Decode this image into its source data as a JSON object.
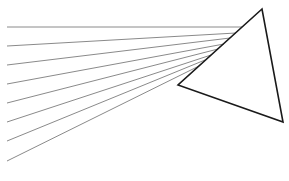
{
  "diagram": {
    "background": "#ffffff",
    "triangle": {
      "stroke": "#1a1a1a",
      "stroke_width": 1.6,
      "points": [
        [
          262,
          9
        ],
        [
          178,
          85
        ],
        [
          283,
          122
        ]
      ]
    },
    "rays": {
      "stroke": "#8a8a8a",
      "stroke_width": 1.0,
      "lines": [
        {
          "x1": 7,
          "y1": 27,
          "x2": 242,
          "y2": 27
        },
        {
          "x1": 7,
          "y1": 46,
          "x2": 236,
          "y2": 33
        },
        {
          "x1": 7,
          "y1": 65,
          "x2": 230,
          "y2": 38
        },
        {
          "x1": 7,
          "y1": 84,
          "x2": 224,
          "y2": 44
        },
        {
          "x1": 7,
          "y1": 103,
          "x2": 218,
          "y2": 49
        },
        {
          "x1": 7,
          "y1": 122,
          "x2": 211,
          "y2": 55
        },
        {
          "x1": 7,
          "y1": 141,
          "x2": 205,
          "y2": 60
        },
        {
          "x1": 7,
          "y1": 161,
          "x2": 199,
          "y2": 66
        }
      ]
    }
  }
}
